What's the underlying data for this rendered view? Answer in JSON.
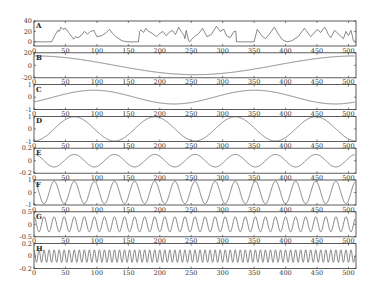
{
  "chart_data": [
    {
      "type": "line",
      "label": "A",
      "xlim": [
        0,
        512
      ],
      "ylim": [
        -8,
        40
      ],
      "yticks": [
        0,
        20,
        40
      ],
      "xticks": [
        0,
        50,
        100,
        150,
        200,
        250,
        300,
        350,
        400,
        450,
        500
      ],
      "x": [
        0,
        28,
        33,
        38,
        40,
        43,
        46,
        50,
        55,
        60,
        63,
        66,
        70,
        75,
        80,
        85,
        90,
        95,
        100,
        108,
        115,
        120,
        125,
        130,
        140,
        148,
        160,
        166,
        168,
        170,
        174,
        178,
        182,
        186,
        190,
        195,
        200,
        205,
        210,
        215,
        220,
        225,
        230,
        235,
        238,
        240,
        242,
        246,
        248,
        250,
        255,
        262,
        268,
        275,
        282,
        290,
        296,
        302,
        306,
        312,
        318,
        321,
        322,
        325,
        335,
        345,
        350,
        355,
        362,
        368,
        375,
        382,
        388,
        395,
        402,
        410,
        420,
        430,
        440,
        445,
        450,
        456,
        462,
        466,
        468,
        472,
        478,
        485,
        492,
        496,
        500,
        504,
        508,
        512
      ],
      "y": [
        0,
        0,
        12,
        22,
        20,
        28,
        24,
        26,
        18,
        10,
        5,
        10,
        8,
        12,
        20,
        15,
        20,
        22,
        10,
        12,
        18,
        24,
        16,
        10,
        2,
        0,
        0,
        0,
        20,
        23,
        18,
        26,
        20,
        18,
        14,
        10,
        16,
        20,
        12,
        18,
        22,
        14,
        28,
        18,
        14,
        6,
        22,
        2,
        0,
        4,
        10,
        16,
        26,
        10,
        14,
        30,
        20,
        24,
        12,
        8,
        20,
        20,
        0,
        0,
        0,
        0,
        0,
        24,
        12,
        6,
        16,
        28,
        16,
        4,
        0,
        2,
        10,
        26,
        10,
        16,
        24,
        18,
        28,
        20,
        14,
        8,
        22,
        14,
        6,
        20,
        12,
        22,
        2,
        0
      ]
    },
    {
      "type": "line",
      "label": "B",
      "func": "amp*cos(2*pi*x/period)",
      "amp": 15,
      "period": 512,
      "phase": 0,
      "offset": 0,
      "ylim": [
        -20,
        20
      ],
      "yticks": [
        -20,
        0,
        20
      ],
      "xticks": [
        0,
        50,
        100,
        150,
        200,
        250,
        300,
        350,
        400,
        450,
        500
      ]
    },
    {
      "type": "line",
      "label": "C",
      "func": "offset+amp*sin(2*pi*(x+phase)/period)",
      "amp": 0.55,
      "period": 256,
      "phase": 30,
      "offset": 0.0,
      "ylim": [
        -1,
        1
      ],
      "yticks": [
        -1,
        0,
        1
      ],
      "xticks": [
        0,
        50,
        100,
        150,
        200,
        250,
        300,
        350,
        400,
        450,
        500
      ]
    },
    {
      "type": "line",
      "label": "D",
      "func": "-amp*cos(2*pi*x/period)",
      "amp": 1,
      "period": 128,
      "ylim": [
        -1,
        1
      ],
      "yticks": [
        -1,
        0,
        1
      ],
      "xticks": [
        0,
        50,
        100,
        150,
        200,
        250,
        300,
        350,
        400,
        450,
        500
      ]
    },
    {
      "type": "line",
      "label": "E",
      "func": "amp*cos(2*pi*x/period)",
      "amp": 0.1,
      "period": 64,
      "ylim": [
        -0.2,
        0.2
      ],
      "yticks": [
        -0.2,
        0,
        0.2
      ],
      "xticks": [
        0,
        50,
        100,
        150,
        200,
        250,
        300,
        350,
        400,
        450,
        500
      ]
    },
    {
      "type": "line",
      "label": "F",
      "func": "amp*cos(2*pi*x/period)",
      "amp": 0.9,
      "period": 32,
      "ylim": [
        -1,
        1
      ],
      "yticks": [
        -1,
        0,
        1
      ],
      "xticks": [
        0,
        50,
        100,
        150,
        200,
        250,
        300,
        350,
        400,
        450,
        500
      ]
    },
    {
      "type": "line",
      "label": "G",
      "func": "amp*cos(2*pi*x/period)",
      "amp": 0.3,
      "period": 16,
      "ylim": [
        -0.5,
        0.5
      ],
      "yticks": [
        -0.5,
        0,
        0.5
      ],
      "xticks": [
        0,
        50,
        100,
        150,
        200,
        250,
        300,
        350,
        400,
        450,
        500
      ]
    },
    {
      "type": "line",
      "label": "H",
      "func": "amp*cos(2*pi*x/period)",
      "amp": 0.1,
      "period": 8,
      "ylim": [
        -0.2,
        0.2
      ],
      "yticks": [
        -0.2,
        0,
        0.2
      ],
      "xticks": [
        0,
        50,
        100,
        150,
        200,
        250,
        300,
        350,
        400,
        450,
        500
      ]
    }
  ],
  "layout": {
    "left": 34,
    "right": 356,
    "top": 21,
    "panel_height": 25,
    "panel_pitch": 31.8
  }
}
